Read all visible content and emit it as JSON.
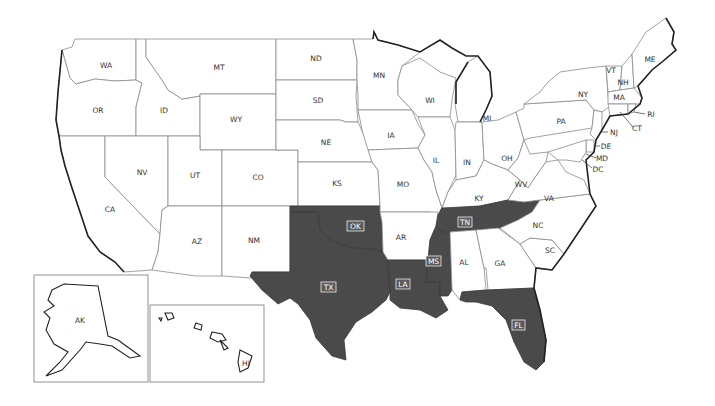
{
  "map": {
    "type": "US states choropleth",
    "highlight_color": "#4a4a4a",
    "base_color": "#ffffff",
    "border_color": "#8a8a8a",
    "highlighted_states": [
      "TX",
      "OK",
      "LA",
      "MS",
      "TN",
      "FL"
    ],
    "states": {
      "WA": "WA",
      "OR": "OR",
      "CA": "CA",
      "ID": "ID",
      "NV": "NV",
      "MT": "MT",
      "WY": "WY",
      "UT": "UT",
      "AZ": "AZ",
      "CO": "CO",
      "NM": "NM",
      "ND": "ND",
      "SD": "SD",
      "NE": "NE",
      "KS": "KS",
      "OK": "OK",
      "TX": "TX",
      "MN": "MN",
      "IA": "IA",
      "MO": "MO",
      "AR": "AR",
      "LA": "LA",
      "WI": "WI",
      "IL": "IL",
      "MS": "MS",
      "MI": "MI",
      "IN": "IN",
      "KY": "KY",
      "TN": "TN",
      "AL": "AL",
      "OH": "OH",
      "GA": "GA",
      "FL": "FL",
      "WV": "WV",
      "VA": "VA",
      "NC": "NC",
      "SC": "SC",
      "PA": "PA",
      "NY": "NY",
      "VT": "VT",
      "NH": "NH",
      "ME": "ME",
      "MA": "MA",
      "RI": "RI",
      "CT": "CT",
      "NJ": "NJ",
      "DE": "DE",
      "MD": "MD",
      "DC": "DC",
      "AK": "AK",
      "HI": "HI"
    },
    "insets": [
      "AK",
      "HI"
    ]
  }
}
